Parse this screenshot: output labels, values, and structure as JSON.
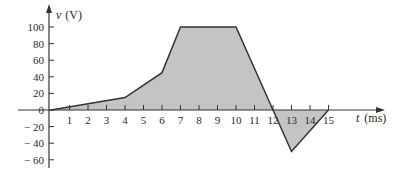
{
  "chart_data": {
    "type": "area",
    "title": "",
    "xlabel": "t (ms)",
    "ylabel": "v (V)",
    "x_var": "t",
    "x_unit": "(ms)",
    "y_var": "v",
    "y_unit": "(V)",
    "x": [
      0,
      4,
      6,
      7,
      10,
      12,
      13,
      15
    ],
    "values": [
      0,
      15,
      45,
      100,
      100,
      0,
      -50,
      0
    ],
    "x_ticks": [
      1,
      2,
      3,
      4,
      5,
      6,
      7,
      8,
      9,
      10,
      11,
      12,
      13,
      14,
      15
    ],
    "y_ticks": [
      100,
      80,
      60,
      40,
      20,
      0,
      -20,
      -40,
      -60
    ],
    "y_tick_labels": [
      "100",
      "80",
      "60",
      "40",
      "20",
      "0",
      "− 20",
      "− 40",
      "− 60"
    ],
    "xlim": [
      0,
      16
    ],
    "ylim": [
      -60,
      110
    ],
    "grid": false,
    "legend": null,
    "fill_color": "#c4c4c4",
    "line_color": "#333333"
  }
}
